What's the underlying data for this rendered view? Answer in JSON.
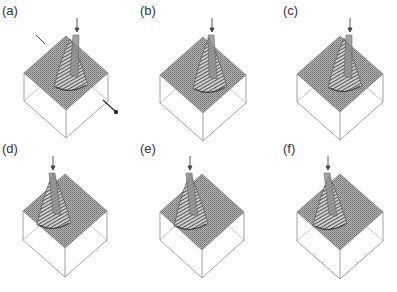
{
  "figure": {
    "panels": [
      {
        "label": "(a)",
        "lx": 2,
        "ly": 3,
        "cx": 66,
        "top": 36,
        "hw": 42,
        "hh": 37,
        "depth": 28,
        "peak": {
          "dx": 4,
          "h": 42
        },
        "arrow_x": 77,
        "arrow_y1": 18,
        "arrow_y2": 31,
        "extra_arrows": true
      },
      {
        "label": "(b)",
        "lx": 140,
        "ly": 3,
        "cx": 203,
        "top": 37,
        "hw": 43,
        "hh": 38,
        "depth": 28,
        "peak": {
          "dx": 6,
          "h": 46
        },
        "arrow_x": 212,
        "arrow_y1": 18,
        "arrow_y2": 31,
        "extra_arrows": false
      },
      {
        "label": "(c)",
        "lx": 283,
        "ly": 3,
        "cx": 340,
        "top": 36,
        "hw": 43,
        "hh": 38,
        "depth": 28,
        "peak": {
          "dx": 4,
          "h": 44
        },
        "arrow_x": 350,
        "arrow_y1": 18,
        "arrow_y2": 31,
        "extra_arrows": false
      },
      {
        "label": "(d)",
        "lx": 2,
        "ly": 141,
        "cx": 65,
        "top": 174,
        "hw": 42,
        "hh": 37,
        "depth": 29,
        "peak": {
          "dx": -12,
          "h": 46
        },
        "arrow_x": 53,
        "arrow_y1": 156,
        "arrow_y2": 169,
        "extra_arrows": false
      },
      {
        "label": "(e)",
        "lx": 140,
        "ly": 141,
        "cx": 202,
        "top": 174,
        "hw": 42,
        "hh": 38,
        "depth": 28,
        "peak": {
          "dx": -12,
          "h": 46
        },
        "arrow_x": 190,
        "arrow_y1": 156,
        "arrow_y2": 169,
        "extra_arrows": false
      },
      {
        "label": "(f)",
        "lx": 283,
        "ly": 141,
        "cx": 340,
        "top": 174,
        "hw": 43,
        "hh": 38,
        "depth": 29,
        "peak": {
          "dx": -11,
          "h": 44
        },
        "arrow_x": 328,
        "arrow_y1": 156,
        "arrow_y2": 169,
        "extra_arrows": false
      }
    ],
    "colors": {
      "surface": "#9a9a9a",
      "grid": "#6f6f6f",
      "box": "#8a8a8a",
      "peak_dark": "#555555",
      "arrow": "#444444",
      "label": "#333333"
    }
  }
}
